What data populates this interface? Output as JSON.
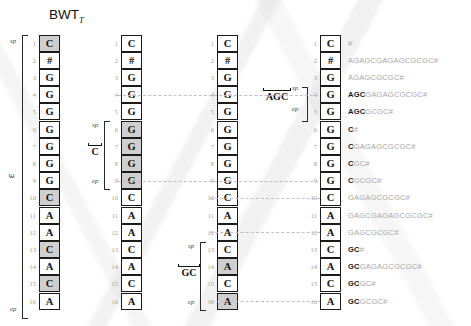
{
  "figure": {
    "title": "BWT",
    "title_subscript": "T",
    "epsilon_label": "ε",
    "sp_label": "sp",
    "ep_label": "ep",
    "row_numbers": [
      1,
      2,
      3,
      4,
      5,
      6,
      7,
      8,
      9,
      10,
      11,
      12,
      13,
      14,
      15,
      16
    ]
  },
  "columns": [
    {
      "id": "col-1",
      "pattern": "",
      "letters": [
        "C",
        "#",
        "G",
        "G",
        "G",
        "G",
        "G",
        "G",
        "G",
        "C",
        "A",
        "A",
        "C",
        "A",
        "C",
        "A"
      ],
      "highlighted_rows": [
        1,
        10,
        13,
        15
      ],
      "bracket": {
        "from": 1,
        "to": 16,
        "label": "ε",
        "sp": "sp",
        "ep": "ep"
      }
    },
    {
      "id": "col-2",
      "pattern": "C",
      "letters": [
        "C",
        "#",
        "G",
        "G",
        "G",
        "G",
        "G",
        "G",
        "G",
        "C",
        "A",
        "A",
        "C",
        "A",
        "C",
        "A"
      ],
      "highlighted_rows": [
        6,
        7,
        8,
        9
      ],
      "bracket": {
        "from": 6,
        "to": 9,
        "label": "C",
        "sp": "sp",
        "ep": "ep"
      }
    },
    {
      "id": "col-3",
      "pattern": "GC",
      "letters": [
        "C",
        "#",
        "G",
        "G",
        "G",
        "G",
        "G",
        "G",
        "G",
        "C",
        "A",
        "A",
        "C",
        "A",
        "C",
        "A"
      ],
      "highlighted_rows": [
        14,
        16
      ],
      "bracket": {
        "from": 13,
        "to": 16,
        "label": "GC",
        "sp": "sp",
        "ep": "ep"
      }
    },
    {
      "id": "col-4",
      "pattern": "AGC",
      "letters": [
        "C",
        "#",
        "G",
        "G",
        "G",
        "G",
        "G",
        "G",
        "G",
        "C",
        "A",
        "A",
        "C",
        "A",
        "C",
        "A"
      ],
      "highlighted_rows": [],
      "bracket": {
        "from": 4,
        "to": 5,
        "label": "AGC",
        "sp": "sp",
        "ep": "ep"
      }
    }
  ],
  "suffixes": [
    {
      "row": 1,
      "prefix": "",
      "rest": "#"
    },
    {
      "row": 2,
      "prefix": "",
      "rest": "AGAGCGAGAGCGCGC#"
    },
    {
      "row": 3,
      "prefix": "",
      "rest": "AGAGCGCGC#"
    },
    {
      "row": 4,
      "prefix": "AGC",
      "rest": "GAGAGCGCGC#"
    },
    {
      "row": 5,
      "prefix": "AGC",
      "rest": "GCGC#"
    },
    {
      "row": 6,
      "prefix": "C",
      "rest": "#"
    },
    {
      "row": 7,
      "prefix": "C",
      "rest": "GAGAGCGCGC#"
    },
    {
      "row": 8,
      "prefix": "C",
      "rest": "GC#"
    },
    {
      "row": 9,
      "prefix": "C",
      "rest": "GCGC#"
    },
    {
      "row": 10,
      "prefix": "",
      "rest": "GAGAGCGCGC#"
    },
    {
      "row": 11,
      "prefix": "",
      "rest": "GAGCGAGAGCGCGC#"
    },
    {
      "row": 12,
      "prefix": "",
      "rest": "GAGCGCGC#"
    },
    {
      "row": 13,
      "prefix": "GC",
      "rest": "#"
    },
    {
      "row": 14,
      "prefix": "GC",
      "rest": "GAGAGCGCGC#"
    },
    {
      "row": 15,
      "prefix": "GC",
      "rest": "GC#"
    },
    {
      "row": 16,
      "prefix": "GC",
      "rest": "GCGC#"
    }
  ],
  "colors": {
    "highlight": "#cfcfcf",
    "cell_border": "#1b1b1b",
    "rownum": "#9a9a9a",
    "suffix_dim": "#a8a8a8",
    "suffix_bold": "#1a1a1a",
    "dash": "#c8b9c8"
  }
}
